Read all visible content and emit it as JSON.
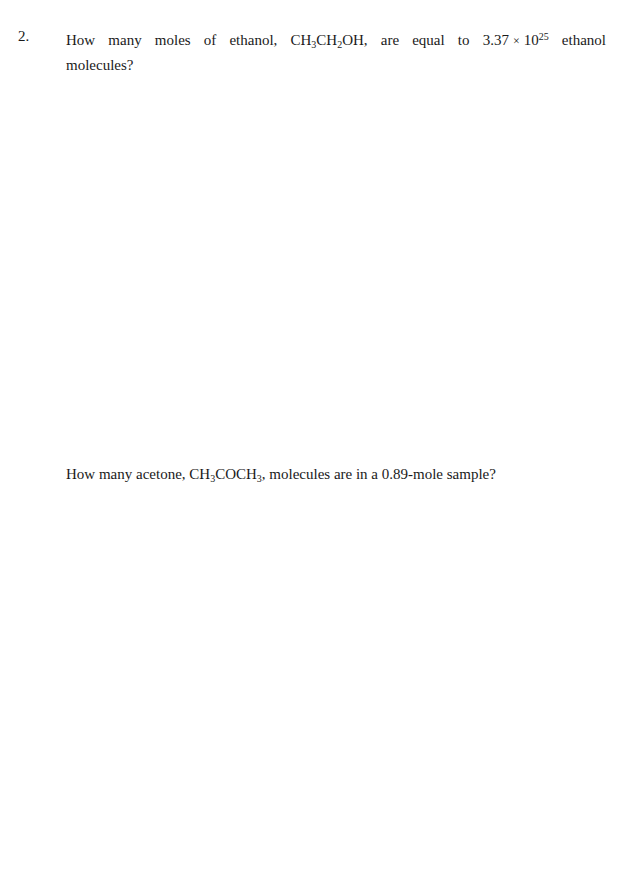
{
  "question": {
    "number": "2.",
    "part1": {
      "text_a": "How many moles of ethanol, CH",
      "sub1": "3",
      "text_b": "CH",
      "sub2": "2",
      "text_c": "OH, are equal to 3.37",
      "times": "×",
      "base": "10",
      "exponent": "25",
      "text_d": "ethanol molecules?"
    },
    "part2": {
      "text_a": "How many acetone, CH",
      "sub1": "3",
      "text_b": "COCH",
      "sub2": "3",
      "text_c": ", molecules are in a 0.89-mole sample?"
    }
  }
}
